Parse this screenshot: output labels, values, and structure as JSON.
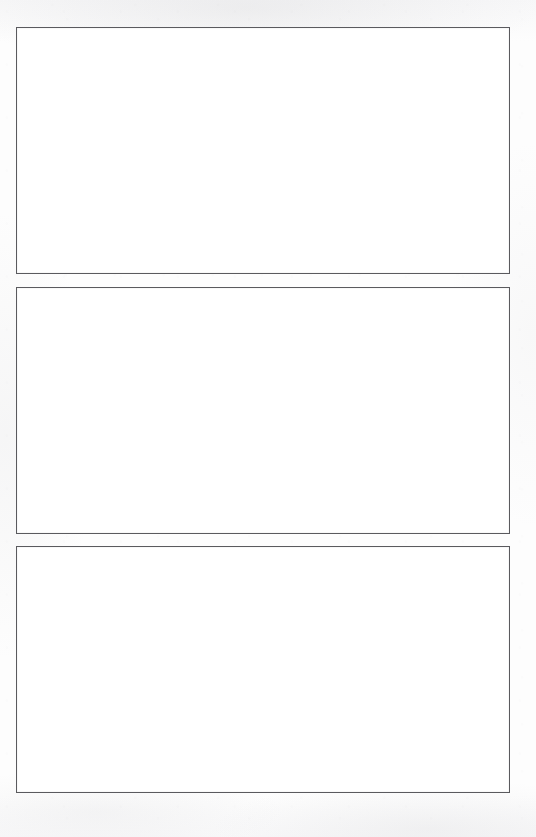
{
  "document": {
    "kind": "scanned-page",
    "page_background_color": "#fbfbfb",
    "panel_fill_color": "#ffffff",
    "panel_border_color": "#5a5a5e",
    "panel_border_width_px": 1.5,
    "page_width_px": 536,
    "page_height_px": 837,
    "visible_text": ""
  },
  "panels": [
    {
      "id": "panel-1",
      "label": "",
      "content": "",
      "x": 16,
      "y": 27,
      "width": 494,
      "height": 247
    },
    {
      "id": "panel-2",
      "label": "",
      "content": "",
      "x": 16,
      "y": 286,
      "width": 494,
      "height": 247
    },
    {
      "id": "panel-3",
      "label": "",
      "content": "",
      "x": 16,
      "y": 546,
      "width": 494,
      "height": 247
    }
  ]
}
